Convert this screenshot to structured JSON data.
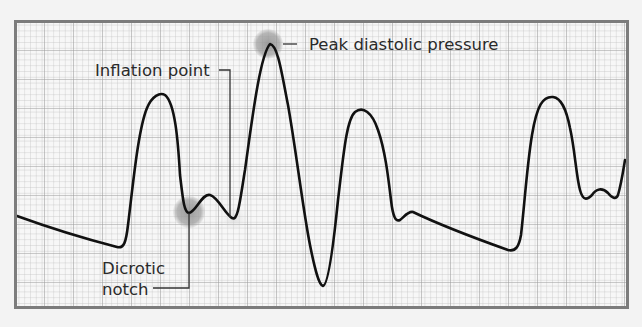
{
  "figure": {
    "type": "arterial pressure waveform on grid paper",
    "colors": {
      "background": "#f3f3f3",
      "paper": "#f7f7f7",
      "grid_minor": "#c4c4c4",
      "grid_major": "#9a9a9a",
      "frame": "#7c7c7c",
      "waveform": "#111111",
      "highlight": "#9a9a9a",
      "leader_line": "#333333",
      "label_text": "#2a2a2a"
    },
    "grid": {
      "x0": 15,
      "y0": 21,
      "x1": 628,
      "y1": 308,
      "minor_step": 5.8,
      "major_every": 5
    }
  },
  "annotations": {
    "peak_diastolic": {
      "label": "Peak diastolic pressure"
    },
    "inflation_point": {
      "label": "Inflation point"
    },
    "dicrotic_notch": {
      "line1": "Dicrotic",
      "line2": "notch"
    }
  }
}
